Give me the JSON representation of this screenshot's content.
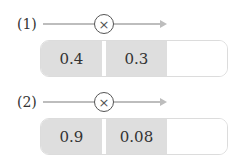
{
  "problems": [
    {
      "label": "(1)",
      "operator": "×",
      "operator_icon": "circled-times-icon",
      "values": [
        "0.4",
        "0.3",
        ""
      ]
    },
    {
      "label": "(2)",
      "operator": "×",
      "operator_icon": "circled-times-icon",
      "values": [
        "0.9",
        "0.08",
        ""
      ]
    }
  ],
  "colors": {
    "filled_cell": "#dedede",
    "arrow": "#bdbdbd",
    "answer_cell": "#ffffff"
  }
}
